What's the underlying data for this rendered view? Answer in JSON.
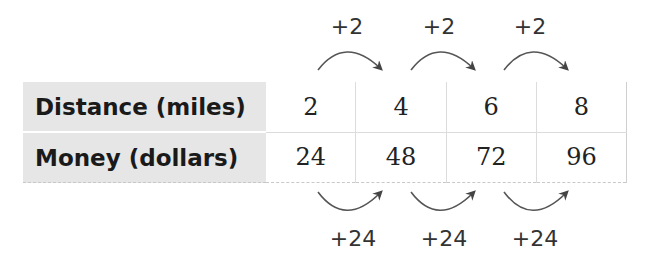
{
  "table": {
    "rows": [
      {
        "label": "Distance (miles)",
        "values": [
          "2",
          "4",
          "6",
          "8"
        ]
      },
      {
        "label": "Money (dollars)",
        "values": [
          "24",
          "48",
          "72",
          "96"
        ]
      }
    ]
  },
  "top_steps": [
    "+2",
    "+2",
    "+2"
  ],
  "bottom_steps": [
    "+24",
    "+24",
    "+24"
  ],
  "colors": {
    "header_bg": "#e6e6e6",
    "arrow": "#444444",
    "text": "#222222"
  }
}
